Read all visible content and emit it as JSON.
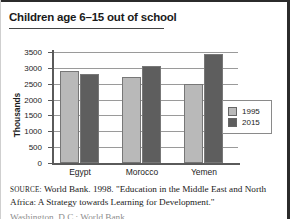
{
  "figure": {
    "title": "Children age 6–15 out of school",
    "source_kicker": "Source:",
    "source_line1": "World Bank. 1998. \"Education in the Middle East and",
    "source_line2": "North Africa: A Strategy towards Learning for Development.\"",
    "source_line3_cropped": "Washington, D.C.: World Bank."
  },
  "colors": {
    "series_1995": "#b9b9b9",
    "series_2015": "#5e5e5e",
    "axis": "#5a5a5a",
    "grid": "#9a9a9a",
    "text": "#1c1c1c",
    "page_border": "#2b2b2b"
  },
  "chart_data": {
    "type": "bar",
    "title": "Children age 6–15 out of school",
    "xlabel": "",
    "ylabel": "Thousands",
    "categories": [
      "Egypt",
      "Morocco",
      "Yemen"
    ],
    "series": [
      {
        "name": "1995",
        "values": [
          2900,
          2700,
          2500
        ]
      },
      {
        "name": "2015",
        "values": [
          2800,
          3050,
          3450
        ]
      }
    ],
    "ylim": [
      0,
      3500
    ],
    "yticks": [
      0,
      500,
      1000,
      1500,
      2000,
      2500,
      3000,
      3500
    ],
    "ytick_labels": [
      "0",
      "500",
      "1000",
      "1500",
      "2000",
      "2500",
      "3000",
      "3500"
    ],
    "grid": true,
    "legend_position": "right-inside",
    "legend_entries": [
      "1995",
      "2015"
    ]
  }
}
